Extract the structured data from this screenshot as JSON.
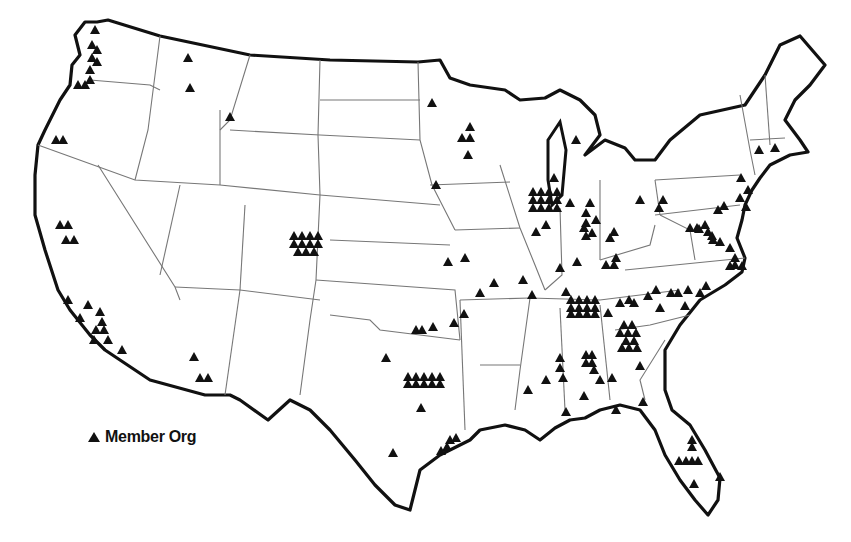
{
  "map": {
    "type": "US states outline with member organization markers",
    "marker_icon": "triangle-icon",
    "marker_color": "#111111",
    "outline_color": "#111111",
    "state_border_color": "#777777"
  },
  "legend": {
    "symbol": "triangle-icon",
    "label": "Member Org"
  },
  "markers": [
    [
      95,
      30
    ],
    [
      92,
      45
    ],
    [
      97,
      50
    ],
    [
      92,
      58
    ],
    [
      97,
      62
    ],
    [
      90,
      70
    ],
    [
      78,
      85
    ],
    [
      85,
      85
    ],
    [
      90,
      80
    ],
    [
      56,
      140
    ],
    [
      63,
      140
    ],
    [
      188,
      58
    ],
    [
      190,
      88
    ],
    [
      230,
      117
    ],
    [
      60,
      225
    ],
    [
      68,
      225
    ],
    [
      66,
      240
    ],
    [
      74,
      240
    ],
    [
      68,
      300
    ],
    [
      88,
      305
    ],
    [
      80,
      318
    ],
    [
      100,
      312
    ],
    [
      102,
      322
    ],
    [
      96,
      330
    ],
    [
      104,
      330
    ],
    [
      94,
      340
    ],
    [
      108,
      340
    ],
    [
      122,
      350
    ],
    [
      194,
      357
    ],
    [
      200,
      378
    ],
    [
      208,
      378
    ],
    [
      432,
      103
    ],
    [
      470,
      127
    ],
    [
      462,
      138
    ],
    [
      470,
      138
    ],
    [
      468,
      155
    ],
    [
      436,
      185
    ],
    [
      533,
      192
    ],
    [
      541,
      192
    ],
    [
      549,
      192
    ],
    [
      557,
      192
    ],
    [
      533,
      200
    ],
    [
      541,
      200
    ],
    [
      549,
      200
    ],
    [
      557,
      200
    ],
    [
      533,
      208
    ],
    [
      541,
      208
    ],
    [
      549,
      208
    ],
    [
      557,
      208
    ],
    [
      554,
      178
    ],
    [
      576,
      140
    ],
    [
      586,
      213
    ],
    [
      546,
      225
    ],
    [
      536,
      232
    ],
    [
      294,
      236
    ],
    [
      302,
      236
    ],
    [
      310,
      236
    ],
    [
      318,
      236
    ],
    [
      294,
      244
    ],
    [
      302,
      244
    ],
    [
      310,
      244
    ],
    [
      318,
      244
    ],
    [
      298,
      252
    ],
    [
      306,
      252
    ],
    [
      314,
      252
    ],
    [
      448,
      262
    ],
    [
      465,
      258
    ],
    [
      494,
      283
    ],
    [
      480,
      293
    ],
    [
      523,
      280
    ],
    [
      532,
      295
    ],
    [
      570,
      203
    ],
    [
      590,
      203
    ],
    [
      586,
      223
    ],
    [
      596,
      220
    ],
    [
      584,
      228
    ],
    [
      592,
      233
    ],
    [
      586,
      236
    ],
    [
      610,
      238
    ],
    [
      614,
      232
    ],
    [
      560,
      268
    ],
    [
      577,
      262
    ],
    [
      566,
      292
    ],
    [
      616,
      258
    ],
    [
      606,
      265
    ],
    [
      614,
      265
    ],
    [
      640,
      200
    ],
    [
      663,
      200
    ],
    [
      690,
      228
    ],
    [
      697,
      228
    ],
    [
      571,
      300
    ],
    [
      579,
      300
    ],
    [
      587,
      300
    ],
    [
      595,
      300
    ],
    [
      571,
      308
    ],
    [
      579,
      308
    ],
    [
      587,
      308
    ],
    [
      595,
      308
    ],
    [
      571,
      314
    ],
    [
      579,
      314
    ],
    [
      587,
      314
    ],
    [
      595,
      314
    ],
    [
      620,
      303
    ],
    [
      629,
      300
    ],
    [
      634,
      303
    ],
    [
      608,
      313
    ],
    [
      648,
      296
    ],
    [
      656,
      290
    ],
    [
      660,
      308
    ],
    [
      671,
      293
    ],
    [
      678,
      293
    ],
    [
      688,
      290
    ],
    [
      700,
      293
    ],
    [
      706,
      286
    ],
    [
      685,
      306
    ],
    [
      620,
      333
    ],
    [
      628,
      333
    ],
    [
      636,
      333
    ],
    [
      624,
      325
    ],
    [
      632,
      325
    ],
    [
      626,
      341
    ],
    [
      634,
      341
    ],
    [
      622,
      348
    ],
    [
      629,
      348
    ],
    [
      637,
      348
    ],
    [
      640,
      366
    ],
    [
      643,
      402
    ],
    [
      586,
      355
    ],
    [
      592,
      355
    ],
    [
      586,
      363
    ],
    [
      592,
      363
    ],
    [
      594,
      370
    ],
    [
      560,
      358
    ],
    [
      560,
      368
    ],
    [
      563,
      378
    ],
    [
      546,
      380
    ],
    [
      600,
      380
    ],
    [
      612,
      378
    ],
    [
      528,
      390
    ],
    [
      584,
      396
    ],
    [
      616,
      410
    ],
    [
      566,
      412
    ],
    [
      433,
      327
    ],
    [
      454,
      323
    ],
    [
      416,
      330
    ],
    [
      422,
      330
    ],
    [
      464,
      314
    ],
    [
      386,
      358
    ],
    [
      408,
      377
    ],
    [
      416,
      377
    ],
    [
      424,
      377
    ],
    [
      432,
      377
    ],
    [
      440,
      377
    ],
    [
      408,
      384
    ],
    [
      416,
      384
    ],
    [
      424,
      384
    ],
    [
      432,
      384
    ],
    [
      440,
      384
    ],
    [
      421,
      408
    ],
    [
      450,
      440
    ],
    [
      456,
      438
    ],
    [
      447,
      447
    ],
    [
      441,
      451
    ],
    [
      393,
      453
    ],
    [
      692,
      440
    ],
    [
      692,
      447
    ],
    [
      679,
      461
    ],
    [
      686,
      461
    ],
    [
      692,
      461
    ],
    [
      698,
      461
    ],
    [
      694,
      484
    ],
    [
      720,
      477
    ],
    [
      659,
      208
    ],
    [
      718,
      210
    ],
    [
      724,
      206
    ],
    [
      740,
      198
    ],
    [
      748,
      190
    ],
    [
      741,
      178
    ],
    [
      775,
      148
    ],
    [
      759,
      150
    ],
    [
      746,
      207
    ],
    [
      699,
      229
    ],
    [
      705,
      225
    ],
    [
      708,
      232
    ],
    [
      712,
      236
    ],
    [
      713,
      240
    ],
    [
      720,
      242
    ],
    [
      730,
      248
    ],
    [
      735,
      258
    ],
    [
      735,
      265
    ],
    [
      730,
      266
    ],
    [
      742,
      266
    ]
  ]
}
